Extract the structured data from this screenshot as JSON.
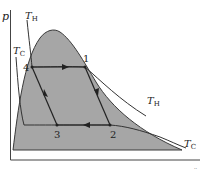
{
  "diagram": {
    "type": "p-V diagram (vapor-compression / Carnot cycle inside two-phase dome)",
    "axis": {
      "y_label": "p",
      "x_label": ""
    },
    "isotherms": [
      {
        "name": "T_H",
        "label_main": "T",
        "label_sub": "H"
      },
      {
        "name": "T_C",
        "label_main": "T",
        "label_sub": "C"
      }
    ],
    "points": [
      {
        "id": "1",
        "label": "1"
      },
      {
        "id": "2",
        "label": "2"
      },
      {
        "id": "3",
        "label": "3"
      },
      {
        "id": "4",
        "label": "4"
      }
    ],
    "process_directions": [
      "4→1",
      "1→2",
      "2→3",
      "3→4"
    ],
    "colors": {
      "dome_fill": "#a6a6a6",
      "line": "#333333",
      "background": "#ffffff"
    },
    "corner_mark": "··"
  }
}
